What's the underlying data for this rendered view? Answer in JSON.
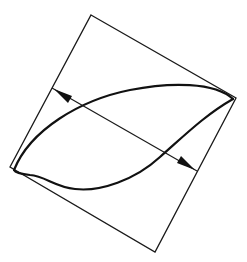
{
  "diagram": {
    "title": "",
    "shapes": {
      "square": {
        "type": "rotated-square",
        "label": ""
      },
      "lens": {
        "type": "closed-curve",
        "label": ""
      },
      "dimension": {
        "type": "double-arrow",
        "label": ""
      }
    },
    "colors": {
      "stroke": "#111111",
      "background": "#ffffff"
    }
  }
}
